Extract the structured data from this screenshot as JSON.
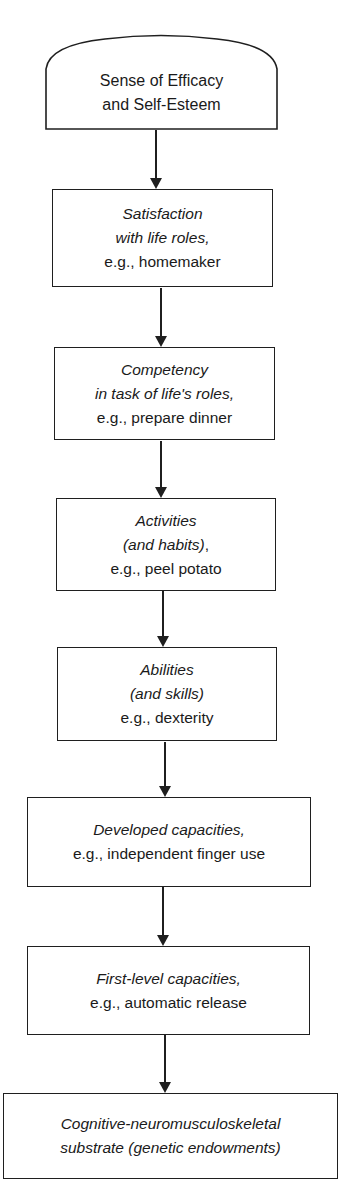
{
  "diagram": {
    "type": "vertical-flowchart",
    "nodes": [
      {
        "id": "efficacy",
        "shape": "rounded-top",
        "lines": [
          {
            "text": "Sense of Efficacy",
            "italic": false
          },
          {
            "text": "and Self-Esteem",
            "italic": false
          }
        ]
      },
      {
        "id": "satisfaction",
        "shape": "rectangle",
        "lines": [
          {
            "text": "Satisfaction",
            "italic": true
          },
          {
            "text": "with life roles,",
            "italic": true
          },
          {
            "text": "e.g., homemaker",
            "italic": false
          }
        ]
      },
      {
        "id": "competency",
        "shape": "rectangle",
        "lines": [
          {
            "text": "Competency",
            "italic": true
          },
          {
            "text": "in task of life's roles,",
            "italic": true
          },
          {
            "text": "e.g., prepare dinner",
            "italic": false
          }
        ]
      },
      {
        "id": "activities",
        "shape": "rectangle",
        "lines": [
          {
            "text": "Activities",
            "italic": true
          },
          {
            "text": "(and habits)",
            "italic": true,
            "suffix": ","
          },
          {
            "text": "e.g., peel potato",
            "italic": false
          }
        ]
      },
      {
        "id": "abilities",
        "shape": "rectangle",
        "lines": [
          {
            "text": "Abilities",
            "italic": true
          },
          {
            "text": "(and skills)",
            "italic": true
          },
          {
            "text": "e.g., dexterity",
            "italic": false
          }
        ]
      },
      {
        "id": "developed-capacities",
        "shape": "rectangle",
        "lines": [
          {
            "text": "Developed capacities,",
            "italic": true
          },
          {
            "text": "e.g., independent finger use",
            "italic": false
          }
        ]
      },
      {
        "id": "first-level-capacities",
        "shape": "rectangle",
        "lines": [
          {
            "text": "First-level capacities,",
            "italic": true
          },
          {
            "text": "e.g., automatic release",
            "italic": false
          }
        ]
      },
      {
        "id": "substrate",
        "shape": "rectangle",
        "lines": [
          {
            "text": "Cognitive-neuromusculoskeletal",
            "italic": true
          },
          {
            "text": "substrate (genetic endowments)",
            "italic": true
          }
        ]
      }
    ],
    "edges": [
      {
        "from": "efficacy",
        "to": "satisfaction"
      },
      {
        "from": "satisfaction",
        "to": "competency"
      },
      {
        "from": "competency",
        "to": "activities"
      },
      {
        "from": "activities",
        "to": "abilities"
      },
      {
        "from": "abilities",
        "to": "developed-capacities"
      },
      {
        "from": "developed-capacities",
        "to": "first-level-capacities"
      },
      {
        "from": "first-level-capacities",
        "to": "substrate"
      }
    ],
    "colors": {
      "stroke": "#1f1f1f",
      "text": "#1a1a1a",
      "background": "#ffffff"
    }
  }
}
